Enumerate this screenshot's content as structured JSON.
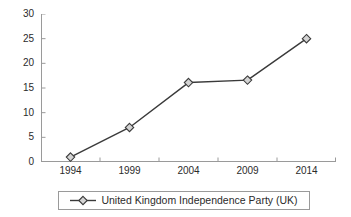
{
  "chart_data": {
    "type": "line",
    "title": "",
    "xlabel": "",
    "ylabel": "",
    "categories": [
      "1994",
      "1999",
      "2004",
      "2009",
      "2014"
    ],
    "series": [
      {
        "name": "United Kingdom Independence Party (UK)",
        "values": [
          1.0,
          7.0,
          16.1,
          16.6,
          25.0
        ]
      }
    ],
    "ylim": [
      0,
      30
    ],
    "y_ticks": [
      "0",
      "5",
      "10",
      "15",
      "20",
      "25",
      "30"
    ],
    "y_tick_values": [
      0,
      5,
      10,
      15,
      20,
      25,
      30
    ],
    "grid": false,
    "legend_position": "bottom",
    "marker": "diamond",
    "line_color": "#3a3a3a",
    "marker_fill": "#d4d4d4",
    "marker_edge": "#3a3a3a",
    "axis_color": "#9a9a9a",
    "background": "#ffffff"
  },
  "legend": {
    "entries": [
      {
        "label": "United Kingdom Independence Party (UK)",
        "marker": "diamond-line-marker"
      }
    ]
  }
}
